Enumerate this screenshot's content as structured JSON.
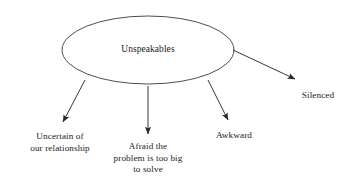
{
  "diagram": {
    "type": "spider-web-concept-map",
    "central_node": {
      "id": "unspeakables",
      "label": "Unspeakables",
      "shape": "ellipse",
      "cx": 148,
      "cy": 50,
      "rx": 86,
      "ry": 34
    },
    "branches": [
      {
        "id": "uncertain",
        "label": "Uncertain of\nour relationship",
        "label_x": 60,
        "label_y": 131,
        "arrow": {
          "x1": 85,
          "y1": 80,
          "x2": 63,
          "y2": 122
        }
      },
      {
        "id": "afraid",
        "label": "Afraid the\nproblem is too big\nto solve",
        "label_x": 148,
        "label_y": 141,
        "arrow": {
          "x1": 148,
          "y1": 86,
          "x2": 148,
          "y2": 134
        }
      },
      {
        "id": "awkward",
        "label": "Awkward",
        "label_x": 234,
        "label_y": 130,
        "arrow": {
          "x1": 208,
          "y1": 80,
          "x2": 228,
          "y2": 120
        }
      },
      {
        "id": "silenced",
        "label": "Silenced",
        "label_x": 318,
        "label_y": 90,
        "arrow": {
          "x1": 233,
          "y1": 50,
          "x2": 295,
          "y2": 79
        }
      }
    ],
    "colors": {
      "background": "#ffffff",
      "stroke": "#2b2b2b",
      "text": "#1a1a1a"
    }
  }
}
